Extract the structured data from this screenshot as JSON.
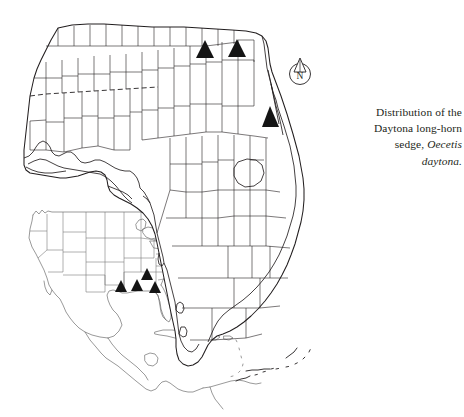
{
  "figure": {
    "kind": "species-distribution-map",
    "background_color": "#ffffff",
    "line_color": "#231f20",
    "inset_line_color": "#6e6e6e",
    "marker_color": "#141414"
  },
  "caption": {
    "line1": "Distribution of the",
    "line2": "Daytona long-horn",
    "line3_prefix": "sedge, ",
    "genus": "Oecetis",
    "species": "daytona.",
    "full_text": "Distribution of the Daytona long-horn sedge, Oecetis daytona."
  },
  "compass": {
    "label": "N",
    "name": "north-arrow"
  },
  "main_map": {
    "name": "florida-county-map",
    "region": "Florida",
    "shows_counties": true,
    "markers": [
      {
        "id": "fl-1",
        "x": 205,
        "y": 52,
        "region": "north-central Florida"
      },
      {
        "id": "fl-2",
        "x": 237,
        "y": 51,
        "region": "northeast Florida"
      },
      {
        "id": "fl-3",
        "x": 271,
        "y": 119,
        "region": "east coast Florida"
      }
    ]
  },
  "inset_map": {
    "name": "north-america-inset-map",
    "region": "North America and Caribbean",
    "shows_states": true,
    "markers": [
      {
        "id": "na-1",
        "x": 121,
        "y": 289,
        "region": "Louisiana"
      },
      {
        "id": "na-2",
        "x": 137,
        "y": 288,
        "region": "Mississippi / Alabama"
      },
      {
        "id": "na-3",
        "x": 155,
        "y": 290,
        "region": "Florida panhandle"
      },
      {
        "id": "na-4",
        "x": 147,
        "y": 277,
        "region": "Georgia / South Carolina"
      }
    ]
  },
  "marker": {
    "shape": "filled-triangle",
    "meaning": "recorded occurrence"
  }
}
